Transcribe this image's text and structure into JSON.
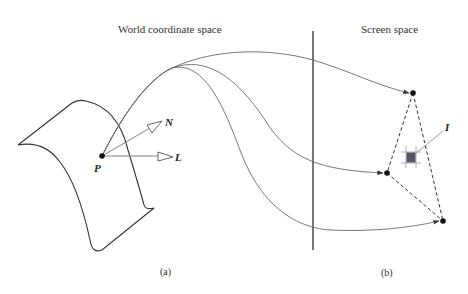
{
  "labels": {
    "world_title": "World coordinate space",
    "screen_title": "Screen space",
    "point_p": "P",
    "vector_n": "N",
    "vector_l": "L",
    "pixel_i": "I",
    "caption_a": "(a)",
    "caption_b": "(b)"
  },
  "colors": {
    "line": "#555555",
    "curve": "#6a6a6a",
    "dot": "#111111",
    "pixel_fill": "#555566",
    "pixel_grid": "#9a9a9a"
  }
}
